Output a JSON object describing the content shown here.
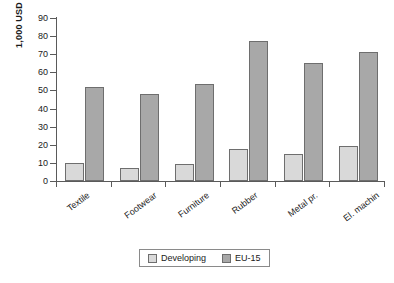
{
  "chart_data": {
    "type": "bar",
    "title": "",
    "subtitle": "",
    "xlabel": "",
    "ylabel": "1,000 USD",
    "ylim": [
      0,
      90
    ],
    "ytick_step": 10,
    "yticks": [
      0,
      10,
      20,
      30,
      40,
      50,
      60,
      70,
      80,
      90
    ],
    "ytick_labels": [
      "0",
      "10",
      "20",
      "30",
      "40",
      "50",
      "60",
      "70",
      "80",
      "90"
    ],
    "grid": false,
    "legend_position": "bottom",
    "categories": [
      "Textile",
      "Footwear",
      "Furniture",
      "Rubber",
      "Metal pr.",
      "El. machin"
    ],
    "series": [
      {
        "name": "Developing",
        "color": "#d9d9d9",
        "values": [
          10,
          7,
          9.5,
          17.5,
          15,
          19.5
        ]
      },
      {
        "name": "EU-15",
        "color": "#a8a8a8",
        "values": [
          52,
          48,
          53.5,
          77.5,
          65,
          71.5
        ]
      }
    ]
  },
  "legend": {
    "entries": [
      {
        "label": "Developing"
      },
      {
        "label": "EU-15"
      }
    ]
  },
  "colors": {
    "developing": "#d9d9d9",
    "eu15": "#a8a8a8",
    "axis": "#5a5a5a",
    "bar_border": "#6e6e6e",
    "background": "#ffffff"
  }
}
